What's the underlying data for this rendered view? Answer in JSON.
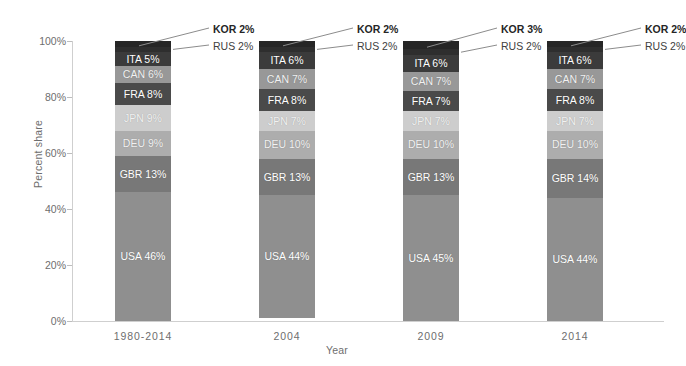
{
  "chart_data": {
    "type": "bar",
    "subtype": "stacked-100-percent",
    "title": "",
    "xlabel": "Year",
    "ylabel": "Percent share",
    "ylim": [
      0,
      100
    ],
    "yticks": [
      "0%",
      "20%",
      "40%",
      "60%",
      "80%",
      "100%"
    ],
    "ytick_values": [
      0,
      20,
      40,
      60,
      80,
      100
    ],
    "grid": false,
    "legend": "none (in-bar data labels)",
    "categories": [
      "1980-2014",
      "2004",
      "2009",
      "2014"
    ],
    "series": [
      {
        "name": "USA",
        "values": [
          46,
          44,
          45,
          44
        ],
        "color": "#8f8f8f"
      },
      {
        "name": "GBR",
        "values": [
          13,
          13,
          13,
          14
        ],
        "color": "#787878"
      },
      {
        "name": "DEU",
        "values": [
          9,
          10,
          10,
          10
        ],
        "color": "#adadad"
      },
      {
        "name": "JPN",
        "values": [
          9,
          7,
          7,
          7
        ],
        "color": "#cdcdcd"
      },
      {
        "name": "FRA",
        "values": [
          8,
          8,
          7,
          8
        ],
        "color": "#4a4a4a"
      },
      {
        "name": "CAN",
        "values": [
          6,
          7,
          7,
          7
        ],
        "color": "#989898"
      },
      {
        "name": "ITA",
        "values": [
          5,
          6,
          6,
          6
        ],
        "color": "#3b3b3b"
      },
      {
        "name": "RUS",
        "values": [
          2,
          2,
          2,
          2
        ],
        "color": "#2e2e2e"
      },
      {
        "name": "KOR",
        "values": [
          2,
          2,
          3,
          2
        ],
        "color": "#262626"
      }
    ],
    "bar_labels": [
      [
        {
          "text": "USA 46%",
          "series": "USA"
        },
        {
          "text": "GBR 13%",
          "series": "GBR"
        },
        {
          "text": "DEU 9%",
          "series": "DEU"
        },
        {
          "text": "JPN 9%",
          "series": "JPN"
        },
        {
          "text": "FRA 8%",
          "series": "FRA"
        },
        {
          "text": "CAN 6%",
          "series": "CAN"
        },
        {
          "text": "ITA 5%",
          "series": "ITA"
        }
      ],
      [
        {
          "text": "USA 44%",
          "series": "USA"
        },
        {
          "text": "GBR 13%",
          "series": "GBR"
        },
        {
          "text": "DEU 10%",
          "series": "DEU"
        },
        {
          "text": "JPN 7%",
          "series": "JPN"
        },
        {
          "text": "FRA 8%",
          "series": "FRA"
        },
        {
          "text": "CAN 7%",
          "series": "CAN"
        },
        {
          "text": "ITA 6%",
          "series": "ITA"
        }
      ],
      [
        {
          "text": "USA 45%",
          "series": "USA"
        },
        {
          "text": "GBR 13%",
          "series": "GBR"
        },
        {
          "text": "DEU 10%",
          "series": "DEU"
        },
        {
          "text": "JPN 7%",
          "series": "JPN"
        },
        {
          "text": "FRA 7%",
          "series": "FRA"
        },
        {
          "text": "CAN 7%",
          "series": "CAN"
        },
        {
          "text": "ITA 6%",
          "series": "ITA"
        }
      ],
      [
        {
          "text": "USA 44%",
          "series": "USA"
        },
        {
          "text": "GBR 14%",
          "series": "GBR"
        },
        {
          "text": "DEU 10%",
          "series": "DEU"
        },
        {
          "text": "JPN 7%",
          "series": "JPN"
        },
        {
          "text": "FRA 8%",
          "series": "FRA"
        },
        {
          "text": "CAN 7%",
          "series": "CAN"
        },
        {
          "text": "ITA 6%",
          "series": "ITA"
        }
      ]
    ],
    "callouts": [
      {
        "bar": 0,
        "kor": "KOR 2%",
        "rus": "RUS 2%"
      },
      {
        "bar": 1,
        "kor": "KOR 2%",
        "rus": "RUS 2%"
      },
      {
        "bar": 2,
        "kor": "KOR 3%",
        "rus": "RUS 2%"
      },
      {
        "bar": 3,
        "kor": "KOR 2%",
        "rus": "RUS 2%"
      }
    ]
  },
  "colors": {
    "background": "#ffffff",
    "axis": "#cfcfcf",
    "tick_text": "#6e6e6e",
    "callout_kor": "#262626",
    "callout_rus": "#404040",
    "leader_line": "#8c8c8c"
  },
  "axes": {
    "y_title": "Percent share",
    "x_title": "Year"
  }
}
